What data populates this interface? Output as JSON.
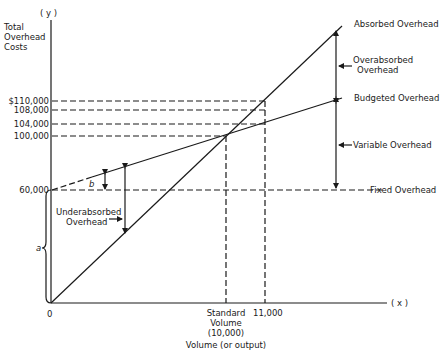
{
  "diagram": {
    "y_axis_symbol": "( y )",
    "x_axis_symbol": "( x )",
    "y_axis_title": [
      "Total",
      "Overhead",
      "Costs"
    ],
    "x_axis_title": "Volume (or output)",
    "origin_label": "0",
    "y_ticks": [
      {
        "label": "$110,000",
        "value": 110000
      },
      {
        "label": "108,000",
        "value": 108000
      },
      {
        "label": "104,000",
        "value": 104000
      },
      {
        "label": "100,000",
        "value": 100000
      },
      {
        "label": "60,000",
        "value": 60000
      }
    ],
    "x_ticks": {
      "standard": [
        "Standard",
        "Volume",
        "(10,000)"
      ],
      "actual": "11,000"
    },
    "lines": {
      "absorbed": "Absorbed Overhead",
      "budgeted": "Budgeted Overhead",
      "fixed": "Fixed Overhead"
    },
    "annotations": {
      "overabsorbed": [
        "Overabsorbed",
        "Overhead"
      ],
      "variable": "Variable Overhead",
      "underabsorbed": [
        "Underabsorbed",
        "Overhead"
      ],
      "a": "a",
      "b": "b"
    },
    "colors": {
      "ink": "#1a1a1a",
      "background": "#ffffff"
    }
  }
}
